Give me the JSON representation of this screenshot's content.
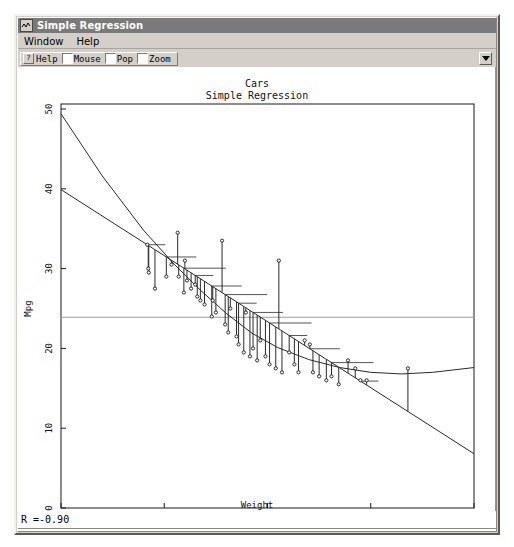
{
  "window": {
    "title": "Simple Regression",
    "icon": "waveform-icon"
  },
  "menu": {
    "items": [
      {
        "label": "Window"
      },
      {
        "label": "Help"
      }
    ]
  },
  "toolbar": {
    "help_glyph": "?",
    "help_label": "Help",
    "checkboxes": [
      {
        "label": "Mouse",
        "checked": false
      },
      {
        "label": "Pop",
        "checked": false
      },
      {
        "label": "Zoom",
        "checked": false
      }
    ],
    "right_button_icon": "dropdown-arrow-icon"
  },
  "status": {
    "text": "R =-0.90"
  },
  "chart_data": {
    "type": "scatter",
    "title": "Cars",
    "subtitle": "Simple Regression",
    "xlabel": "Weight",
    "ylabel": "Mpg",
    "xlim": [
      1,
      5
    ],
    "ylim": [
      0,
      50
    ],
    "xticks": [
      "1",
      "2",
      "3",
      "4",
      "5"
    ],
    "yticks": [
      "0",
      "10",
      "20",
      "30",
      "40",
      "50"
    ],
    "grid": false,
    "mean_line_y": 23.9,
    "correlation": -0.9,
    "legend": null,
    "points": [
      {
        "x": 1.835,
        "y": 33.0
      },
      {
        "x": 1.845,
        "y": 30.0
      },
      {
        "x": 1.85,
        "y": 29.5
      },
      {
        "x": 1.91,
        "y": 27.5
      },
      {
        "x": 2.02,
        "y": 29.0
      },
      {
        "x": 2.07,
        "y": 30.5
      },
      {
        "x": 2.13,
        "y": 34.5
      },
      {
        "x": 2.14,
        "y": 29.0
      },
      {
        "x": 2.19,
        "y": 27.0
      },
      {
        "x": 2.2,
        "y": 31.0
      },
      {
        "x": 2.22,
        "y": 28.5
      },
      {
        "x": 2.26,
        "y": 27.5
      },
      {
        "x": 2.3,
        "y": 28.0
      },
      {
        "x": 2.32,
        "y": 26.5
      },
      {
        "x": 2.35,
        "y": 26.0
      },
      {
        "x": 2.39,
        "y": 25.5
      },
      {
        "x": 2.46,
        "y": 24.0
      },
      {
        "x": 2.47,
        "y": 26.0
      },
      {
        "x": 2.5,
        "y": 24.5
      },
      {
        "x": 2.56,
        "y": 33.5
      },
      {
        "x": 2.59,
        "y": 23.0
      },
      {
        "x": 2.62,
        "y": 22.0
      },
      {
        "x": 2.64,
        "y": 25.0
      },
      {
        "x": 2.7,
        "y": 21.5
      },
      {
        "x": 2.72,
        "y": 20.5
      },
      {
        "x": 2.77,
        "y": 19.5
      },
      {
        "x": 2.79,
        "y": 24.5
      },
      {
        "x": 2.83,
        "y": 19.0
      },
      {
        "x": 2.86,
        "y": 20.0
      },
      {
        "x": 2.9,
        "y": 18.5
      },
      {
        "x": 2.93,
        "y": 21.0
      },
      {
        "x": 2.98,
        "y": 19.0
      },
      {
        "x": 3.02,
        "y": 18.0
      },
      {
        "x": 3.08,
        "y": 17.5
      },
      {
        "x": 3.11,
        "y": 31.0
      },
      {
        "x": 3.14,
        "y": 17.0
      },
      {
        "x": 3.21,
        "y": 19.5
      },
      {
        "x": 3.26,
        "y": 18.0
      },
      {
        "x": 3.3,
        "y": 17.0
      },
      {
        "x": 3.36,
        "y": 21.0
      },
      {
        "x": 3.41,
        "y": 20.5
      },
      {
        "x": 3.44,
        "y": 17.0
      },
      {
        "x": 3.5,
        "y": 16.5
      },
      {
        "x": 3.57,
        "y": 16.0
      },
      {
        "x": 3.62,
        "y": 16.5
      },
      {
        "x": 3.69,
        "y": 15.5
      },
      {
        "x": 3.78,
        "y": 18.5
      },
      {
        "x": 3.85,
        "y": 17.5
      },
      {
        "x": 3.9,
        "y": 16.0
      },
      {
        "x": 3.96,
        "y": 16.0
      },
      {
        "x": 4.36,
        "y": 17.5
      }
    ],
    "series": [
      {
        "name": "regression-line",
        "type": "line",
        "shape": "straight",
        "points": [
          [
            1.0,
            39.9
          ],
          [
            5.0,
            6.8
          ]
        ]
      },
      {
        "name": "smoother-curve",
        "type": "line",
        "shape": "curved",
        "points": [
          [
            1.0,
            49.4
          ],
          [
            1.4,
            41.6
          ],
          [
            1.8,
            34.8
          ],
          [
            2.1,
            30.5
          ],
          [
            2.35,
            27.3
          ],
          [
            2.6,
            24.4
          ],
          [
            2.85,
            21.9
          ],
          [
            3.1,
            20.1
          ],
          [
            3.4,
            18.6
          ],
          [
            3.7,
            17.6
          ],
          [
            4.0,
            17.0
          ],
          [
            4.3,
            16.8
          ],
          [
            4.6,
            17.0
          ],
          [
            5.0,
            17.6
          ]
        ]
      }
    ]
  }
}
